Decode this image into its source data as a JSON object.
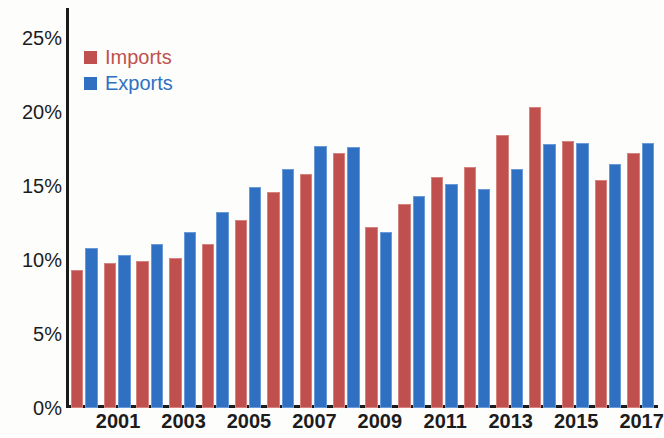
{
  "chart_data": {
    "type": "bar",
    "title": "",
    "subtitle": "",
    "xlabel": "",
    "ylabel": "",
    "ylim": [
      0,
      27
    ],
    "ytick_values": [
      0,
      5,
      10,
      15,
      20,
      25
    ],
    "ytick_labels": [
      "0%",
      "5%",
      "10%",
      "15%",
      "20%",
      "25%"
    ],
    "grid": false,
    "legend_position": "top-left",
    "categories": [
      "2000",
      "2001",
      "2002",
      "2003",
      "2004",
      "2005",
      "2006",
      "2007",
      "2008",
      "2009",
      "2010",
      "2011",
      "2012",
      "2013",
      "2014",
      "2015",
      "2016",
      "2017"
    ],
    "xtick_labels_shown": [
      "2001",
      "2003",
      "2005",
      "2007",
      "2009",
      "2011",
      "2013",
      "2015",
      "2017"
    ],
    "series": [
      {
        "name": "Imports",
        "color": "#c0504d",
        "values": [
          9.3,
          9.8,
          9.9,
          10.1,
          11.1,
          12.7,
          14.6,
          15.8,
          17.2,
          12.2,
          13.8,
          15.6,
          16.3,
          18.4,
          20.3,
          18.0,
          15.4,
          17.2
        ]
      },
      {
        "name": "Exports",
        "color": "#2f70c2",
        "values": [
          10.8,
          10.3,
          11.1,
          11.9,
          13.2,
          14.9,
          16.1,
          17.7,
          17.6,
          11.9,
          14.3,
          15.1,
          14.8,
          16.1,
          17.8,
          17.9,
          16.5,
          17.9
        ]
      }
    ]
  },
  "legend": {
    "items": [
      {
        "label": "Imports",
        "key": "imports"
      },
      {
        "label": "Exports",
        "key": "exports"
      }
    ]
  }
}
